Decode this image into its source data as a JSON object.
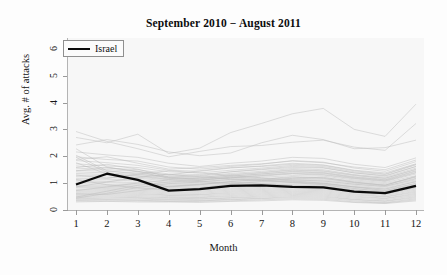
{
  "chart_data": {
    "type": "line",
    "title": "September 2010 − August 2011",
    "xlabel": "Month",
    "ylabel": "Avg. # of attacks",
    "xlim": [
      1,
      12
    ],
    "ylim": [
      0,
      6.4
    ],
    "x": [
      1,
      2,
      3,
      4,
      5,
      6,
      7,
      8,
      9,
      10,
      11,
      12
    ],
    "xticks": [
      "1",
      "2",
      "3",
      "4",
      "5",
      "6",
      "7",
      "8",
      "9",
      "10",
      "11",
      "12"
    ],
    "yticks": [
      "0",
      "1",
      "2",
      "3",
      "4",
      "5",
      "6"
    ],
    "grid": false,
    "legend_position": "top-left",
    "legend": [
      {
        "name": "Israel",
        "color": "#0a0a0a",
        "width": 2.4
      }
    ],
    "background_colors": {
      "figure": "#fdfdfd",
      "panel": "#f7f7f7",
      "axis": "#b4b4b4",
      "background_series": "#b9b9b9",
      "highlight_series": "#0a0a0a"
    },
    "highlight_series": {
      "name": "Israel",
      "color": "#0a0a0a",
      "values": [
        0.95,
        1.35,
        1.12,
        0.72,
        0.78,
        0.9,
        0.92,
        0.86,
        0.84,
        0.68,
        0.63,
        0.9
      ]
    },
    "series": [
      {
        "name": "country-01",
        "values": [
          2.92,
          2.55,
          2.28,
          1.98,
          2.18,
          2.36,
          2.4,
          2.52,
          2.6,
          2.34,
          2.22,
          3.22
        ]
      },
      {
        "name": "country-02",
        "values": [
          2.7,
          2.5,
          2.82,
          2.1,
          2.3,
          2.88,
          3.22,
          3.58,
          3.78,
          3.0,
          2.74,
          3.94
        ]
      },
      {
        "name": "country-03",
        "values": [
          2.42,
          2.62,
          2.44,
          2.16,
          2.02,
          2.12,
          2.5,
          2.78,
          2.62,
          2.28,
          2.32,
          2.6
        ]
      },
      {
        "name": "country-04",
        "values": [
          2.16,
          2.05,
          1.96,
          1.74,
          1.62,
          1.74,
          1.82,
          1.96,
          1.92,
          1.7,
          1.58,
          1.94
        ]
      },
      {
        "name": "country-05",
        "values": [
          1.98,
          1.88,
          1.82,
          1.6,
          1.52,
          1.62,
          1.7,
          1.84,
          1.78,
          1.56,
          1.44,
          1.8
        ]
      },
      {
        "name": "country-06",
        "values": [
          1.84,
          1.76,
          1.66,
          1.48,
          1.44,
          1.56,
          1.64,
          1.74,
          1.68,
          1.48,
          1.38,
          1.72
        ]
      },
      {
        "name": "country-07",
        "values": [
          1.72,
          1.64,
          1.58,
          1.42,
          1.38,
          1.48,
          1.56,
          1.66,
          1.62,
          1.42,
          1.32,
          1.68
        ]
      },
      {
        "name": "country-08",
        "values": [
          1.64,
          1.56,
          1.5,
          1.34,
          1.32,
          1.42,
          1.5,
          1.58,
          1.56,
          1.38,
          1.28,
          1.62
        ]
      },
      {
        "name": "country-09",
        "values": [
          1.56,
          1.5,
          1.44,
          1.3,
          1.26,
          1.36,
          1.44,
          1.54,
          1.5,
          1.32,
          1.22,
          1.56
        ]
      },
      {
        "name": "country-10",
        "values": [
          1.48,
          1.44,
          1.38,
          1.24,
          1.22,
          1.3,
          1.38,
          1.48,
          1.44,
          1.28,
          1.18,
          1.5
        ]
      },
      {
        "name": "country-11",
        "values": [
          1.42,
          1.38,
          1.32,
          1.2,
          1.18,
          1.26,
          1.34,
          1.44,
          1.4,
          1.24,
          1.14,
          1.46
        ]
      },
      {
        "name": "country-12",
        "values": [
          1.36,
          1.32,
          1.28,
          1.16,
          1.14,
          1.22,
          1.3,
          1.38,
          1.36,
          1.2,
          1.1,
          1.4
        ]
      },
      {
        "name": "country-13",
        "values": [
          1.3,
          1.28,
          1.22,
          1.12,
          1.1,
          1.18,
          1.26,
          1.34,
          1.3,
          1.16,
          1.06,
          1.34
        ]
      },
      {
        "name": "country-14",
        "values": [
          1.24,
          1.22,
          1.18,
          1.08,
          1.06,
          1.14,
          1.22,
          1.28,
          1.26,
          1.12,
          1.02,
          1.28
        ]
      },
      {
        "name": "country-15",
        "values": [
          1.18,
          1.16,
          1.12,
          1.04,
          1.02,
          1.1,
          1.16,
          1.24,
          1.2,
          1.08,
          0.98,
          1.22
        ]
      },
      {
        "name": "country-16",
        "values": [
          1.12,
          1.12,
          1.08,
          1.0,
          0.98,
          1.06,
          1.12,
          1.18,
          1.16,
          1.04,
          0.94,
          1.18
        ]
      },
      {
        "name": "country-17",
        "values": [
          1.08,
          1.06,
          1.02,
          0.96,
          0.94,
          1.02,
          1.08,
          1.14,
          1.12,
          1.0,
          0.9,
          1.12
        ]
      },
      {
        "name": "country-18",
        "values": [
          1.02,
          1.02,
          0.98,
          0.92,
          0.9,
          0.98,
          1.04,
          1.1,
          1.08,
          0.96,
          0.86,
          1.08
        ]
      },
      {
        "name": "country-19",
        "values": [
          0.98,
          0.96,
          0.94,
          0.88,
          0.86,
          0.94,
          1.0,
          1.06,
          1.04,
          0.92,
          0.82,
          1.04
        ]
      },
      {
        "name": "country-20",
        "values": [
          0.92,
          0.92,
          0.9,
          0.84,
          0.82,
          0.9,
          0.96,
          1.02,
          1.0,
          0.88,
          0.78,
          0.98
        ]
      },
      {
        "name": "country-21",
        "values": [
          0.88,
          0.88,
          0.86,
          0.8,
          0.78,
          0.86,
          0.92,
          0.98,
          0.96,
          0.84,
          0.74,
          0.94
        ]
      },
      {
        "name": "country-22",
        "values": [
          0.84,
          0.84,
          0.82,
          0.76,
          0.74,
          0.82,
          0.88,
          0.94,
          0.92,
          0.8,
          0.7,
          0.9
        ]
      },
      {
        "name": "country-23",
        "values": [
          0.78,
          0.8,
          0.78,
          0.72,
          0.7,
          0.78,
          0.84,
          0.9,
          0.88,
          0.76,
          0.66,
          0.86
        ]
      },
      {
        "name": "country-24",
        "values": [
          0.74,
          0.76,
          0.74,
          0.68,
          0.66,
          0.74,
          0.8,
          0.86,
          0.84,
          0.72,
          0.62,
          0.82
        ]
      },
      {
        "name": "country-25",
        "values": [
          0.7,
          0.72,
          0.7,
          0.64,
          0.62,
          0.7,
          0.76,
          0.82,
          0.8,
          0.68,
          0.58,
          0.78
        ]
      },
      {
        "name": "country-26",
        "values": [
          0.66,
          0.68,
          0.66,
          0.6,
          0.58,
          0.66,
          0.72,
          0.78,
          0.76,
          0.64,
          0.54,
          0.74
        ]
      },
      {
        "name": "country-27",
        "values": [
          0.62,
          0.64,
          0.62,
          0.56,
          0.56,
          0.62,
          0.68,
          0.74,
          0.72,
          0.6,
          0.5,
          0.7
        ]
      },
      {
        "name": "country-28",
        "values": [
          0.58,
          0.6,
          0.58,
          0.54,
          0.52,
          0.58,
          0.64,
          0.7,
          0.68,
          0.56,
          0.48,
          0.66
        ]
      },
      {
        "name": "country-29",
        "values": [
          0.54,
          0.56,
          0.54,
          0.5,
          0.48,
          0.54,
          0.6,
          0.66,
          0.64,
          0.52,
          0.44,
          0.62
        ]
      },
      {
        "name": "country-30",
        "values": [
          0.5,
          0.52,
          0.5,
          0.46,
          0.46,
          0.5,
          0.56,
          0.62,
          0.6,
          0.48,
          0.42,
          0.58
        ]
      },
      {
        "name": "country-31",
        "values": [
          0.46,
          0.48,
          0.46,
          0.44,
          0.42,
          0.46,
          0.52,
          0.58,
          0.56,
          0.44,
          0.38,
          0.54
        ]
      },
      {
        "name": "country-32",
        "values": [
          0.42,
          0.44,
          0.44,
          0.4,
          0.4,
          0.44,
          0.48,
          0.54,
          0.52,
          0.4,
          0.34,
          0.5
        ]
      },
      {
        "name": "country-33",
        "values": [
          0.4,
          0.4,
          0.4,
          0.38,
          0.36,
          0.4,
          0.44,
          0.5,
          0.48,
          0.38,
          0.32,
          0.46
        ]
      },
      {
        "name": "country-34",
        "values": [
          0.36,
          0.38,
          0.36,
          0.34,
          0.34,
          0.38,
          0.42,
          0.46,
          0.44,
          0.34,
          0.28,
          0.42
        ]
      },
      {
        "name": "country-35",
        "values": [
          0.34,
          0.34,
          0.34,
          0.32,
          0.32,
          0.34,
          0.38,
          0.42,
          0.4,
          0.3,
          0.26,
          0.38
        ]
      },
      {
        "name": "country-36",
        "values": [
          0.3,
          0.32,
          0.3,
          0.3,
          0.28,
          0.32,
          0.34,
          0.38,
          0.36,
          0.28,
          0.24,
          0.34
        ]
      },
      {
        "name": "country-37",
        "values": [
          2.28,
          1.6,
          1.42,
          1.3,
          1.46,
          1.58,
          1.62,
          1.7,
          1.66,
          1.46,
          1.34,
          1.7
        ]
      },
      {
        "name": "country-38",
        "values": [
          2.04,
          1.46,
          1.34,
          1.22,
          1.28,
          1.42,
          1.52,
          1.62,
          1.58,
          1.38,
          1.26,
          1.62
        ]
      },
      {
        "name": "country-39",
        "values": [
          1.76,
          1.34,
          1.26,
          1.14,
          1.2,
          1.32,
          1.4,
          1.5,
          1.46,
          1.3,
          1.18,
          1.52
        ]
      },
      {
        "name": "country-40",
        "values": [
          1.58,
          1.7,
          1.52,
          1.22,
          1.16,
          1.26,
          1.34,
          1.42,
          1.38,
          1.22,
          1.12,
          1.44
        ]
      },
      {
        "name": "country-41",
        "values": [
          1.46,
          1.58,
          1.44,
          1.18,
          1.12,
          1.2,
          1.28,
          1.36,
          1.32,
          1.18,
          1.08,
          1.38
        ]
      },
      {
        "name": "country-42",
        "values": [
          0.48,
          0.7,
          0.92,
          1.04,
          1.1,
          1.22,
          1.16,
          1.08,
          1.0,
          0.86,
          0.72,
          1.0
        ]
      },
      {
        "name": "country-43",
        "values": [
          0.44,
          0.62,
          0.84,
          0.98,
          1.04,
          1.14,
          1.1,
          1.02,
          0.94,
          0.8,
          0.68,
          0.94
        ]
      },
      {
        "name": "country-44",
        "values": [
          1.96,
          1.4,
          1.1,
          0.86,
          0.94,
          1.06,
          1.14,
          1.22,
          1.18,
          1.02,
          0.92,
          1.24
        ]
      },
      {
        "name": "country-45",
        "values": [
          1.3,
          1.18,
          1.34,
          1.46,
          1.38,
          1.28,
          1.2,
          1.12,
          1.08,
          0.96,
          0.88,
          1.16
        ]
      },
      {
        "name": "country-46",
        "values": [
          0.86,
          1.04,
          1.22,
          1.32,
          1.24,
          1.16,
          1.1,
          1.04,
          0.98,
          0.86,
          0.78,
          1.06
        ]
      },
      {
        "name": "country-47",
        "values": [
          0.6,
          0.58,
          0.72,
          0.88,
          0.96,
          1.04,
          0.98,
          0.92,
          0.88,
          0.74,
          0.64,
          0.88
        ]
      },
      {
        "name": "country-48",
        "values": [
          1.14,
          0.94,
          0.82,
          0.74,
          0.82,
          0.96,
          1.06,
          1.18,
          1.22,
          1.04,
          0.92,
          1.26
        ]
      },
      {
        "name": "country-49",
        "values": [
          0.72,
          0.86,
          1.0,
          1.12,
          1.06,
          0.98,
          0.92,
          0.86,
          0.82,
          0.7,
          0.6,
          0.84
        ]
      },
      {
        "name": "country-50",
        "values": [
          1.88,
          1.98,
          1.74,
          1.52,
          1.58,
          1.66,
          1.72,
          1.82,
          1.76,
          1.6,
          1.5,
          1.86
        ]
      }
    ]
  }
}
